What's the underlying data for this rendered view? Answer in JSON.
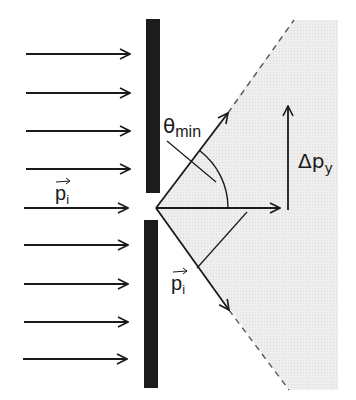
{
  "diagram": {
    "colors": {
      "ink": "#1a1a1a",
      "barrier": "#1c1c1c",
      "shade": "#ececec",
      "background": "#ffffff"
    },
    "incoming_arrows": {
      "count": 9,
      "x_start": 26,
      "x_end": 130,
      "y_positions": [
        54,
        93,
        131,
        169,
        208,
        245,
        284,
        322,
        359
      ]
    },
    "barrier": {
      "upper": {
        "x": 146,
        "y_top": 19,
        "y_bottom": 193,
        "width": 14
      },
      "lower": {
        "x": 144,
        "y_top": 220,
        "y_bottom": 388,
        "width": 14
      }
    },
    "slit_vertex": {
      "x": 156,
      "y": 208
    },
    "labels": {
      "incoming_momentum": {
        "symbol": "p",
        "subscript": "i",
        "vector": true
      },
      "theta_min": {
        "symbol": "θ",
        "subscript": "min"
      },
      "delta_py": {
        "symbol": "Δp",
        "subscript": "y"
      },
      "outgoing_momentum": {
        "symbol": "p",
        "subscript": "i",
        "vector": true
      }
    },
    "vectors": {
      "upper_diffracted": {
        "from": [
          156,
          208
        ],
        "to": [
          228,
          113
        ]
      },
      "horizontal": {
        "from": [
          156,
          208
        ],
        "to": [
          280,
          208
        ]
      },
      "lower_diffracted": {
        "from": [
          156,
          208
        ],
        "to": [
          229,
          310
        ]
      },
      "delta_py": {
        "from": [
          288,
          210
        ],
        "to": [
          288,
          105
        ]
      }
    },
    "angle_arc": {
      "center": [
        156,
        208
      ],
      "radius": 72,
      "label": "θmin"
    },
    "dashed_boundaries": {
      "upper": {
        "from": [
          228,
          113
        ],
        "to": [
          294,
          20
        ]
      },
      "lower": {
        "from": [
          229,
          310
        ],
        "to": [
          289,
          390
        ]
      }
    },
    "shaded_region": {
      "right_x": 338,
      "top_y": 20,
      "bottom_y": 390
    }
  }
}
